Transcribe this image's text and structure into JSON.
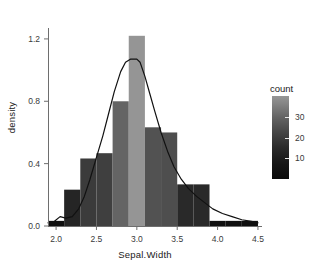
{
  "chart_data": {
    "type": "bar",
    "title": "",
    "subtitle": "",
    "xlabel": "Sepal.Width",
    "ylabel": "density",
    "xlim": [
      1.9,
      4.55
    ],
    "ylim": [
      0.0,
      1.27
    ],
    "xticks": [
      "2.0",
      "2.5",
      "3.0",
      "3.5",
      "4.0",
      "4.5"
    ],
    "xtick_values": [
      2.0,
      2.5,
      3.0,
      3.5,
      4.0,
      4.5
    ],
    "yticks": [
      "0.0",
      "0.4",
      "0.8",
      "1.2"
    ],
    "ytick_values": [
      0.0,
      0.4,
      0.8,
      1.2
    ],
    "grid": false,
    "binwidth": 0.2,
    "n": 150,
    "bin_centers": [
      2.0,
      2.2,
      2.4,
      2.6,
      2.8,
      3.0,
      3.2,
      3.4,
      3.6,
      3.8,
      4.0,
      4.2,
      4.4
    ],
    "bin_starts": [
      1.9,
      2.1,
      2.3,
      2.5,
      2.7,
      2.9,
      3.1,
      3.3,
      3.5,
      3.7,
      3.9,
      4.1,
      4.3
    ],
    "bin_ends": [
      2.1,
      2.3,
      2.5,
      2.7,
      2.9,
      3.1,
      3.3,
      3.5,
      3.7,
      3.9,
      4.1,
      4.3,
      4.5
    ],
    "values": [
      0.033,
      0.233,
      0.433,
      0.467,
      0.8,
      1.22,
      0.633,
      0.6,
      0.267,
      0.267,
      0.033,
      0.033,
      0.033
    ],
    "counts": [
      1,
      7,
      13,
      14,
      24,
      37,
      19,
      18,
      8,
      8,
      1,
      1,
      1
    ],
    "fill_mapping": "count",
    "density_curve": {
      "label": "density",
      "color": "#111111",
      "x": [
        1.9,
        1.98,
        2.05,
        2.12,
        2.2,
        2.28,
        2.35,
        2.42,
        2.5,
        2.58,
        2.65,
        2.72,
        2.8,
        2.86,
        2.92,
        2.97,
        3.0,
        3.04,
        3.1,
        3.16,
        3.22,
        3.3,
        3.38,
        3.46,
        3.55,
        3.64,
        3.74,
        3.84,
        3.94,
        4.06,
        4.18,
        4.3,
        4.42,
        4.5
      ],
      "y": [
        0.02,
        0.03,
        0.06,
        0.05,
        0.06,
        0.11,
        0.19,
        0.3,
        0.44,
        0.58,
        0.72,
        0.86,
        0.99,
        1.05,
        1.07,
        1.07,
        1.07,
        1.05,
        0.96,
        0.85,
        0.74,
        0.6,
        0.48,
        0.38,
        0.3,
        0.24,
        0.19,
        0.15,
        0.11,
        0.08,
        0.06,
        0.04,
        0.03,
        0.02
      ]
    },
    "legend": {
      "title": "count",
      "position": "right",
      "type": "colorbar",
      "ticks": [
        "10",
        "20",
        "30"
      ],
      "tick_values": [
        10,
        20,
        30
      ],
      "range": [
        0,
        40
      ],
      "low_color": "#0b0b0b",
      "high_color": "#999999"
    }
  }
}
